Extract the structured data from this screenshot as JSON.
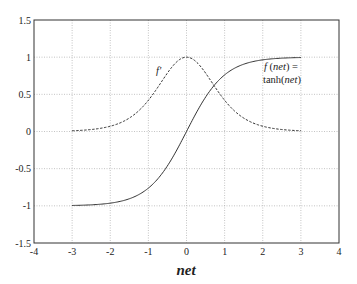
{
  "chart_data": {
    "type": "line",
    "title": "",
    "xlabel": "net",
    "ylabel": "",
    "xlim": [
      -4,
      4
    ],
    "ylim": [
      -1.5,
      1.5
    ],
    "grid": true,
    "legend": null,
    "x_ticks": [
      -4,
      -3,
      -2,
      -1,
      0,
      1,
      2,
      3,
      4
    ],
    "x_tick_labels": [
      "-4",
      "-3",
      "-2",
      "-1",
      "0",
      "1",
      "2",
      "3",
      "4"
    ],
    "y_ticks": [
      -1.5,
      -1,
      -0.5,
      0,
      0.5,
      1,
      1.5
    ],
    "y_tick_labels": [
      "-1.5",
      "-1",
      "-0.5",
      "0",
      "0.5",
      "1",
      "1.5"
    ],
    "x": [
      -3,
      -2.5,
      -2,
      -1.5,
      -1,
      -0.5,
      0,
      0.5,
      1,
      1.5,
      2,
      2.5,
      3
    ],
    "series": [
      {
        "name": "f(net) = tanh(net)",
        "style": "solid",
        "values": [
          -0.995,
          -0.987,
          -0.964,
          -0.905,
          -0.762,
          -0.462,
          0,
          0.462,
          0.762,
          0.905,
          0.964,
          0.987,
          0.995
        ]
      },
      {
        "name": "f'",
        "style": "dashed",
        "values": [
          0.01,
          0.026,
          0.071,
          0.181,
          0.42,
          0.786,
          1,
          0.786,
          0.42,
          0.181,
          0.071,
          0.026,
          0.01
        ]
      }
    ],
    "annotations": [
      {
        "text": "f'",
        "x": -0.75,
        "y": 0.85
      },
      {
        "text": "f (net) =",
        "x": 2.5,
        "y": 0.72
      },
      {
        "text": "tanh(net)",
        "x": 2.5,
        "y": 0.55
      }
    ]
  },
  "labels": {
    "xlabel": "net",
    "fprime": "f'",
    "f_line1_a": "f",
    "f_line1_b": " (",
    "f_line1_c": "net",
    "f_line1_d": ")  =",
    "f_line2_a": "tanh(",
    "f_line2_b": "net",
    "f_line2_c": ")"
  }
}
